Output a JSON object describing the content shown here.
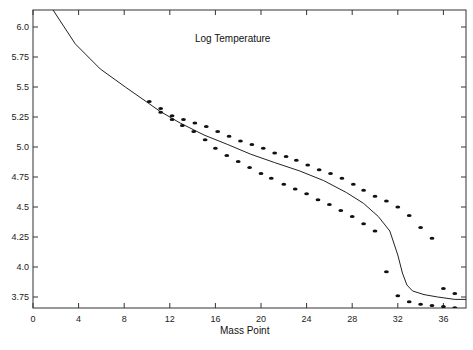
{
  "chart_data": {
    "type": "line",
    "title": "Log Temperature",
    "xlabel": "Mass Point",
    "ylabel": "",
    "xlim": [
      0,
      38
    ],
    "ylim": [
      3.65,
      6.15
    ],
    "grid": false,
    "legend": null,
    "x_ticks": [
      0,
      4,
      8,
      12,
      16,
      20,
      24,
      28,
      32,
      36
    ],
    "x_tick_labels": [
      "0",
      "4",
      "8",
      "12",
      "16",
      "20",
      "24",
      "28",
      "32",
      "36"
    ],
    "y_ticks": [
      3.75,
      4.0,
      4.25,
      4.5,
      4.75,
      5.0,
      5.25,
      5.5,
      5.75,
      6.0
    ],
    "y_tick_labels": [
      "3.75",
      "4.0",
      "4.25",
      "4.5",
      "4.75",
      "5.0",
      "5.25",
      "5.5",
      "5.75",
      "6.0"
    ],
    "series": [
      {
        "name": "Model curve",
        "style": "line",
        "x": [
          1.7,
          3.7,
          5.9,
          8.1,
          9.9,
          11.1,
          12.9,
          15.0,
          17.1,
          19.1,
          21.2,
          23.4,
          25.5,
          27.5,
          29.0,
          30.3,
          31.3,
          32.0,
          32.4,
          32.8,
          33.3,
          34.3,
          35.5,
          37.0,
          38.0
        ],
        "y": [
          6.15,
          5.86,
          5.65,
          5.5,
          5.38,
          5.3,
          5.2,
          5.1,
          5.02,
          4.94,
          4.87,
          4.8,
          4.72,
          4.62,
          4.53,
          4.42,
          4.3,
          4.1,
          3.95,
          3.85,
          3.8,
          3.77,
          3.75,
          3.73,
          3.73
        ]
      },
      {
        "name": "Upper bound points",
        "style": "scatter",
        "x": [
          10.2,
          11.2,
          12.2,
          13.2,
          14.2,
          15.2,
          16.2,
          17.2,
          18.2,
          19.2,
          20.2,
          21.2,
          22.2,
          23.1,
          24.1,
          25.1,
          26.1,
          27.1,
          28.1,
          29.0,
          30.0,
          31.0,
          32.0,
          33.0,
          34.0,
          35.0,
          36.0,
          37.0
        ],
        "y": [
          5.38,
          5.32,
          5.26,
          5.23,
          5.2,
          5.17,
          5.13,
          5.09,
          5.05,
          5.02,
          4.99,
          4.95,
          4.92,
          4.89,
          4.85,
          4.81,
          4.78,
          4.74,
          4.69,
          4.64,
          4.59,
          4.55,
          4.5,
          4.43,
          4.33,
          4.24,
          3.82,
          3.78
        ]
      },
      {
        "name": "Lower bound points",
        "style": "scatter",
        "x": [
          11.2,
          12.2,
          13.1,
          14.1,
          15.1,
          16.0,
          17.0,
          18.0,
          19.0,
          20.0,
          20.9,
          22.0,
          23.0,
          24.0,
          25.0,
          26.0,
          27.0,
          28.0,
          29.0,
          30.0,
          31.0,
          32.0,
          33.0,
          34.0,
          35.0,
          36.0,
          37.0
        ],
        "y": [
          5.29,
          5.23,
          5.18,
          5.13,
          5.06,
          4.99,
          4.93,
          4.88,
          4.83,
          4.78,
          4.74,
          4.69,
          4.65,
          4.61,
          4.56,
          4.52,
          4.47,
          4.42,
          4.36,
          4.3,
          3.96,
          3.76,
          3.71,
          3.69,
          3.68,
          3.67,
          3.66
        ]
      }
    ],
    "annotations": [
      "Log Temperature"
    ]
  }
}
